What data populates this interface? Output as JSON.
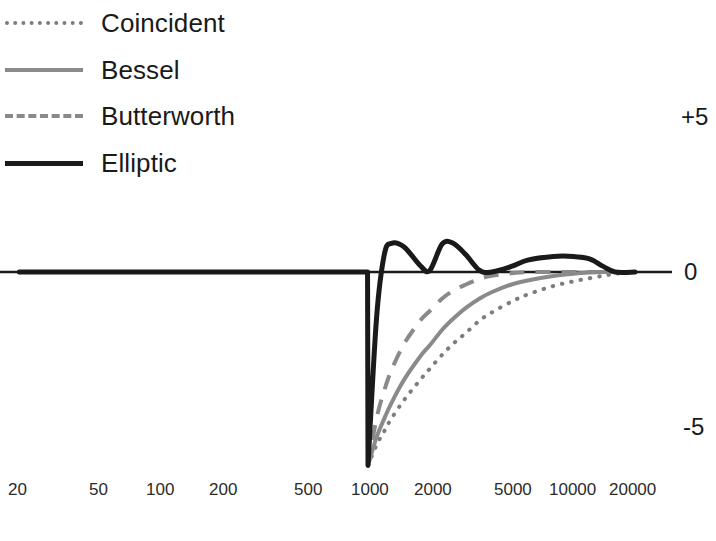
{
  "legend": {
    "items": [
      {
        "label": "Coincident",
        "style": "dotted",
        "color": "#7d7d7d"
      },
      {
        "label": "Bessel",
        "style": "solid",
        "color": "#8a8a8a"
      },
      {
        "label": "Butterworth",
        "style": "dashed",
        "color": "#8a8a8a"
      },
      {
        "label": "Elliptic",
        "style": "solid-thick",
        "color": "#1a1a1a"
      }
    ]
  },
  "axes": {
    "y_ticks": [
      "+5",
      "0",
      "-5"
    ],
    "x_ticks": [
      "20",
      "50",
      "100",
      "200",
      "500",
      "1000",
      "2000",
      "5000",
      "10000",
      "20000"
    ]
  },
  "chart_data": {
    "type": "line",
    "title": "",
    "xlabel": "",
    "ylabel": "",
    "xscale": "log",
    "xlim": [
      20,
      20000
    ],
    "ylim": [
      -6.2,
      5
    ],
    "grid": false,
    "legend_position": "top-left",
    "x": [
      20,
      50,
      100,
      200,
      500,
      800,
      1000,
      1100,
      1200,
      1300,
      1500,
      1800,
      2000,
      2300,
      2600,
      3000,
      3500,
      4000,
      5000,
      6000,
      8000,
      10000,
      12000,
      14000,
      16000,
      20000
    ],
    "series": [
      {
        "name": "Coincident",
        "style": "dotted",
        "color": "#7d7d7d",
        "values": [
          0,
          0,
          0,
          0,
          0,
          0,
          -6.2,
          -5.55,
          -5.1,
          -4.7,
          -4.1,
          -3.45,
          -3.1,
          -2.65,
          -2.3,
          -1.95,
          -1.55,
          -1.3,
          -0.95,
          -0.72,
          -0.45,
          -0.3,
          -0.2,
          -0.12,
          -0.06,
          0
        ]
      },
      {
        "name": "Bessel",
        "style": "solid",
        "color": "#8a8a8a",
        "values": [
          0,
          0,
          0,
          0,
          0,
          0,
          -6.2,
          -5.3,
          -4.7,
          -4.2,
          -3.45,
          -2.7,
          -2.35,
          -1.85,
          -1.5,
          -1.15,
          -0.85,
          -0.65,
          -0.4,
          -0.27,
          -0.13,
          -0.06,
          -0.02,
          0,
          0,
          0
        ]
      },
      {
        "name": "Butterworth",
        "style": "dashed",
        "color": "#8a8a8a",
        "values": [
          0,
          0,
          0,
          0,
          0,
          0,
          -6.2,
          -4.7,
          -3.8,
          -3.15,
          -2.3,
          -1.55,
          -1.25,
          -0.85,
          -0.6,
          -0.4,
          -0.22,
          -0.12,
          -0.04,
          0,
          0,
          0,
          0,
          0,
          0,
          0
        ]
      },
      {
        "name": "Elliptic",
        "style": "solid-thick",
        "color": "#1a1a1a",
        "values": [
          0,
          0,
          0,
          0,
          0,
          -0.05,
          -6.2,
          -1.5,
          0.55,
          0.92,
          0.8,
          0.2,
          0.05,
          0.9,
          0.92,
          0.55,
          0.05,
          0.0,
          0.18,
          0.38,
          0.5,
          0.5,
          0.42,
          0.18,
          0.0,
          0.0
        ]
      }
    ],
    "annotations": {
      "zero_line": 0,
      "passband_ripple_db": 0.9,
      "corner_frequency_hz": 1000,
      "max_dip_db": -6.2
    }
  }
}
